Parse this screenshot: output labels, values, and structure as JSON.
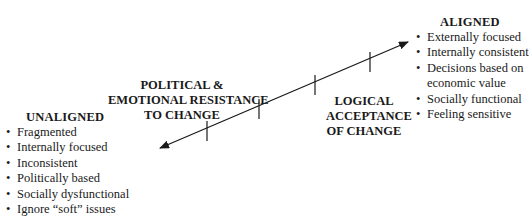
{
  "unaligned": {
    "title": "UNALIGNED",
    "items": [
      "Fragmented",
      "Internally focused",
      "Inconsistent",
      "Politically based",
      "Socially dysfunctional",
      "Ignore “soft” issues"
    ]
  },
  "aligned": {
    "title": "ALIGNED",
    "items": [
      "Externally focused",
      "Internally consistent",
      "Decisions based on",
      "economic value",
      "Socially functional",
      "Feeling sensitive"
    ]
  },
  "resistance_label": {
    "line1": "POLITICAL &",
    "line2": "EMOTIONAL RESISTANCE",
    "line3": "TO CHANGE"
  },
  "acceptance_label": {
    "line1": "LOGICAL",
    "line2": "ACCEPTANCE",
    "line3": "OF CHANGE"
  },
  "axis": {
    "color": "#1a1a1a",
    "start": [
      160,
      148
    ],
    "end": [
      408,
      42
    ],
    "tick_count": 4
  }
}
